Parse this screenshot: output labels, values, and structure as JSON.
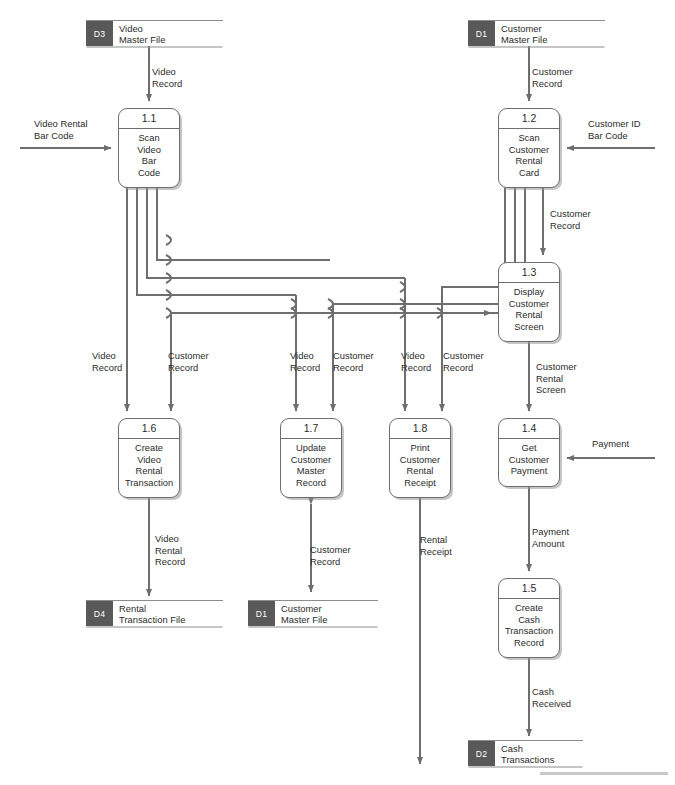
{
  "diagram": {
    "type": "data-flow-diagram",
    "line_color": "#6e6e6e",
    "store_tag_color": "#595959",
    "background": "#ffffff"
  },
  "processes": [
    {
      "id": "1.1",
      "name": "Scan\nVideo\nBar\nCode",
      "x": 118,
      "y": 108,
      "w": 62,
      "h": 80
    },
    {
      "id": "1.2",
      "name": "Scan\nCustomer\nRental\nCard",
      "x": 498,
      "y": 108,
      "w": 62,
      "h": 80
    },
    {
      "id": "1.3",
      "name": "Display\nCustomer\nRental\nScreen",
      "x": 498,
      "y": 262,
      "w": 62,
      "h": 80
    },
    {
      "id": "1.4",
      "name": "Get\nCustomer\nPayment",
      "x": 498,
      "y": 418,
      "w": 62,
      "h": 69
    },
    {
      "id": "1.5",
      "name": "Create\nCash\nTransaction\nRecord",
      "x": 498,
      "y": 578,
      "w": 62,
      "h": 80
    },
    {
      "id": "1.6",
      "name": "Create\nVideo\nRental\nTransaction",
      "x": 118,
      "y": 418,
      "w": 62,
      "h": 80
    },
    {
      "id": "1.7",
      "name": "Update\nCustomer\nMaster\nRecord",
      "x": 280,
      "y": 418,
      "w": 62,
      "h": 80
    },
    {
      "id": "1.8",
      "name": "Print\nCustomer\nRental\nReceipt",
      "x": 389,
      "y": 418,
      "w": 62,
      "h": 80
    }
  ],
  "data_stores": [
    {
      "tag": "D3",
      "name": "Video\nMaster File",
      "x": 86,
      "y": 20,
      "w": 137
    },
    {
      "tag": "D1",
      "name": "Customer\nMaster File",
      "x": 468,
      "y": 20,
      "w": 137
    },
    {
      "tag": "D4",
      "name": "Rental\nTransaction File",
      "x": 86,
      "y": 600,
      "w": 137
    },
    {
      "tag": "D1",
      "name": "Customer\nMaster File",
      "x": 248,
      "y": 600,
      "w": 130
    },
    {
      "tag": "D2",
      "name": "Cash\nTransactions",
      "x": 468,
      "y": 740,
      "w": 115
    }
  ],
  "external_inputs": [
    {
      "label": "Video Rental\nBar Code",
      "x": 34,
      "y": 118,
      "align": "left"
    },
    {
      "label": "Customer ID\nBar Code",
      "x": 588,
      "y": 118,
      "align": "left"
    },
    {
      "label": "Payment",
      "x": 592,
      "y": 438,
      "align": "left"
    }
  ],
  "flow_labels": [
    {
      "text": "Video\nRecord",
      "x": 152,
      "y": 66
    },
    {
      "text": "Customer\nRecord",
      "x": 532,
      "y": 66
    },
    {
      "text": "Customer\nRecord",
      "x": 550,
      "y": 208
    },
    {
      "text": "Video\nRecord",
      "x": 92,
      "y": 350
    },
    {
      "text": "Customer\nRecord",
      "x": 168,
      "y": 350
    },
    {
      "text": "Video\nRecord",
      "x": 290,
      "y": 350
    },
    {
      "text": "Customer\nRecord",
      "x": 333,
      "y": 350
    },
    {
      "text": "Video\nRecord",
      "x": 401,
      "y": 350
    },
    {
      "text": "Customer\nRecord",
      "x": 443,
      "y": 350
    },
    {
      "text": "Customer\nRental\nScreen",
      "x": 536,
      "y": 361
    },
    {
      "text": "Video\nRental\nRecord",
      "x": 155,
      "y": 533
    },
    {
      "text": "Customer\nRecord",
      "x": 310,
      "y": 544
    },
    {
      "text": "Rental\nReceipt",
      "x": 420,
      "y": 534
    },
    {
      "text": "Payment\nAmount",
      "x": 532,
      "y": 526
    },
    {
      "text": "Cash\nReceived",
      "x": 532,
      "y": 686
    }
  ]
}
